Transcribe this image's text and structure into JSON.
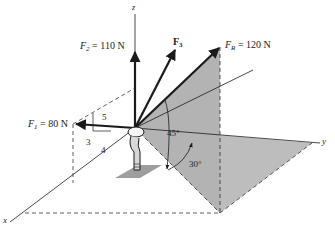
{
  "diagram": {
    "axes": {
      "x_label": "x",
      "y_label": "y",
      "z_label": "z"
    },
    "forces": [
      {
        "id": "F1",
        "symbol": "F",
        "subscript": "1",
        "label_suffix": " = 80 N",
        "magnitude": "80 N",
        "slope_triangle": {
          "rise": "3",
          "run": "4",
          "hyp": "5"
        }
      },
      {
        "id": "F2",
        "symbol": "F",
        "subscript": "2",
        "label_suffix": " = 110 N",
        "magnitude": "110 N"
      },
      {
        "id": "F3",
        "symbol": "F",
        "subscript": "3",
        "label_suffix": "",
        "magnitude": ""
      },
      {
        "id": "FR",
        "symbol": "F",
        "subscript": "R",
        "label_suffix": " = 120 N",
        "magnitude": "120 N"
      }
    ],
    "angles": {
      "elevation": "45°",
      "azimuth": "30°"
    },
    "colors": {
      "line": "#1a1a1a",
      "shade": "#bdbdbd",
      "shade_dark": "#a8a8a8",
      "background": "#ffffff"
    }
  }
}
